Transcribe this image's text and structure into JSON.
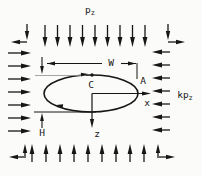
{
  "diagram": {
    "colors": {
      "ink": "#161616",
      "paper": "#fbfbf9",
      "faint": "#8f8f8f"
    },
    "labels": {
      "vertical_stress": {
        "base": "p",
        "sub": "z"
      },
      "horizontal_stress": {
        "base": "kp",
        "sub": "z"
      },
      "width_dim": "W",
      "height_dim": "H",
      "crown_point": "C",
      "sidewall_point": "A",
      "axis_x": "x",
      "axis_z": "z"
    },
    "geometry": {
      "ellipse": {
        "cx": 91,
        "cy": 93.5,
        "rx": 47,
        "ry": 18.5,
        "stroke": 1.6
      },
      "crown_dot": {
        "x": 92,
        "y": 75,
        "r": 1.7
      },
      "groups": [
        {
          "name": "top-stress-arrows",
          "head": {
            "l": 10,
            "w": 2.4
          },
          "stroke": 1.3,
          "arrows": [
            [
              45,
              25,
              45,
              47
            ],
            [
              57.5,
              25,
              57.5,
              47
            ],
            [
              70,
              25,
              70,
              47
            ],
            [
              82.5,
              25,
              82.5,
              47
            ],
            [
              95,
              25,
              95,
              47
            ],
            [
              107.5,
              25,
              107.5,
              47
            ],
            [
              120,
              25,
              120,
              47
            ],
            [
              132.5,
              25,
              132.5,
              47
            ],
            [
              145,
              25,
              145,
              47
            ]
          ]
        },
        {
          "name": "bottom-stress-arrows",
          "head": {
            "l": 10,
            "w": 2.4
          },
          "stroke": 1.3,
          "arrows": [
            [
              32,
              162,
              32,
              144
            ],
            [
              46,
              162,
              46,
              144
            ],
            [
              60,
              162,
              60,
              144
            ],
            [
              74,
              162,
              74,
              144
            ],
            [
              88,
              162,
              88,
              144
            ],
            [
              102,
              162,
              102,
              144
            ],
            [
              116,
              162,
              116,
              144
            ],
            [
              130,
              162,
              130,
              144
            ],
            [
              144,
              162,
              144,
              144
            ]
          ]
        },
        {
          "name": "left-stress-arrows",
          "head": {
            "l": 10,
            "w": 2.4
          },
          "stroke": 1.3,
          "arrows": [
            [
              8,
              53,
              31,
              53
            ],
            [
              8,
              66,
              31,
              66
            ],
            [
              8,
              79,
              31,
              79
            ],
            [
              8,
              92,
              31,
              92
            ],
            [
              8,
              105,
              31,
              105
            ],
            [
              8,
              118,
              31,
              118
            ],
            [
              8,
              131,
              31,
              131
            ]
          ]
        },
        {
          "name": "right-stress-arrows",
          "head": {
            "l": 10,
            "w": 2.4
          },
          "stroke": 1.3,
          "arrows": [
            [
              170,
              52,
              152,
              52
            ],
            [
              170,
              65,
              152,
              65
            ],
            [
              170,
              78,
              152,
              78
            ],
            [
              170,
              91,
              152,
              91
            ],
            [
              170,
              104,
              152,
              104
            ],
            [
              170,
              117,
              152,
              117
            ],
            [
              170,
              130,
              152,
              130
            ]
          ]
        },
        {
          "name": "corner-arrows",
          "head": {
            "l": 9,
            "w": 2.2
          },
          "stroke": 1.3,
          "arrows": [
            [
              27,
              24,
              27,
              40
            ],
            [
              27,
              42,
              11,
              42
            ],
            [
              168,
              24,
              168,
              40
            ],
            [
              168,
              42,
              185,
              42
            ],
            [
              25,
              156,
              25,
              144
            ],
            [
              26,
              157,
              9,
              157
            ],
            [
              158,
              156,
              158,
              144
            ],
            [
              157,
              157,
              175,
              157
            ]
          ]
        },
        {
          "name": "dimension-arrows",
          "head": {
            "l": 8,
            "w": 1.9
          },
          "stroke": 1.1,
          "arrows": [
            [
              102,
              63.5,
              47,
              63.5
            ],
            [
              121,
              63.5,
              136,
              63.5
            ],
            [
              42,
              57,
              42,
              74
            ],
            [
              42,
              128,
              42,
              113
            ]
          ]
        },
        {
          "name": "axis-arrows",
          "head": {
            "l": 9,
            "w": 2.1
          },
          "stroke": 1.2,
          "arrows": [
            [
              92,
              93.5,
              151,
              93.5
            ],
            [
              92,
              93.5,
              92,
              128
            ]
          ]
        }
      ],
      "lines": [
        [
          47,
          63.5,
          102,
          63.5
        ],
        [
          121,
          63.5,
          136,
          63.5
        ],
        [
          137,
          63,
          137,
          79
        ],
        [
          34,
          112,
          96,
          112
        ]
      ],
      "faint_lines": [
        [
          35,
          75.5,
          86,
          75.5
        ]
      ],
      "free_heads": [
        [
          88,
          74,
          -5,
          7,
          1.9
        ],
        [
          56,
          105,
          190,
          7,
          1.9
        ]
      ]
    }
  }
}
